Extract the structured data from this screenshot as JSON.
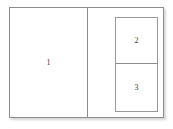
{
  "diagram": {
    "frame": {
      "name": "outer-frame",
      "border_color": "#8d8d8d",
      "background_color": "#ffffff"
    },
    "panes": [
      {
        "id": "pane-1",
        "label": "1",
        "position": "left",
        "description": "Large left pane occupying the left half of the frame"
      },
      {
        "id": "pane-2",
        "label": "2",
        "position": "inner-top",
        "description": "Top pane inside the nested box on the right"
      },
      {
        "id": "pane-3",
        "label": "3",
        "position": "inner-bottom",
        "description": "Bottom pane inside the nested box on the right"
      }
    ],
    "dividers": [
      {
        "id": "divider-vertical",
        "orientation": "vertical",
        "color": "#8d8d8d"
      },
      {
        "id": "divider-horizontal",
        "orientation": "horizontal",
        "color": "#8d8d8d"
      }
    ],
    "inner_box": {
      "name": "nested-box",
      "border_color": "#9a9a9a",
      "background_color": "#ffffff"
    }
  }
}
